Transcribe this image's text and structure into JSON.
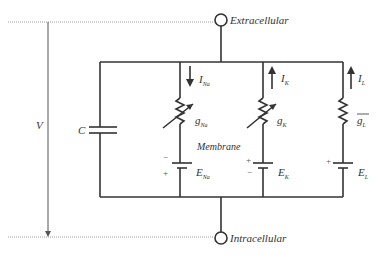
{
  "diagram": {
    "terminals": {
      "top": "Extracellular",
      "bottom": "Intracellular"
    },
    "voltage_label": "V",
    "capacitor_label": "C",
    "membrane_label": "Membrane",
    "branches": [
      {
        "id": "na",
        "current": "I",
        "current_sub": "Na",
        "current_dir": "down",
        "conductance": "g",
        "conductance_sub": "Na",
        "variable": true,
        "emf": "E",
        "emf_sub": "Na",
        "top_sign": "−",
        "bottom_sign": "+"
      },
      {
        "id": "k",
        "current": "I",
        "current_sub": "K",
        "current_dir": "up",
        "conductance": "g",
        "conductance_sub": "K",
        "variable": true,
        "emf": "E",
        "emf_sub": "K",
        "top_sign": "+",
        "bottom_sign": "−"
      },
      {
        "id": "l",
        "current": "I",
        "current_sub": "L",
        "current_dir": "up",
        "conductance": "g",
        "conductance_sub": "L",
        "variable": false,
        "overbar": true,
        "emf": "E",
        "emf_sub": "L",
        "top_sign": "+",
        "bottom_sign": ""
      }
    ],
    "colors": {
      "wire": "#333333",
      "dotted": "#888888",
      "background": "#ffffff"
    }
  }
}
